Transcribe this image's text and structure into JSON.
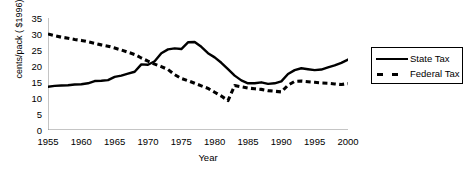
{
  "chart_data": {
    "type": "line",
    "title": "",
    "xlabel": "Year",
    "ylabel": "cents/pack ( $1996)",
    "xlim": [
      1955,
      2000
    ],
    "ylim": [
      0,
      35
    ],
    "ytick_step": 5,
    "xtick_step": 5,
    "minor_xticks": "every year",
    "grid": false,
    "legend_position": "right-outside",
    "yticks": [
      "0",
      "5",
      "10",
      "15",
      "20",
      "25",
      "30",
      "35"
    ],
    "xticks": [
      "1955",
      "1960",
      "1965",
      "1970",
      "1975",
      "1980",
      "1985",
      "1990",
      "1995",
      "2000"
    ],
    "x": [
      1955,
      1956,
      1957,
      1958,
      1959,
      1960,
      1961,
      1962,
      1963,
      1964,
      1965,
      1966,
      1967,
      1968,
      1969,
      1970,
      1971,
      1972,
      1973,
      1974,
      1975,
      1976,
      1977,
      1978,
      1979,
      1980,
      1981,
      1982,
      1983,
      1984,
      1985,
      1986,
      1987,
      1988,
      1989,
      1990,
      1991,
      1992,
      1993,
      1994,
      1995,
      1996,
      1997,
      1998,
      1999,
      2000
    ],
    "series": [
      {
        "name": "State Tax",
        "style": "solid",
        "color": "#000000",
        "values": [
          13.5,
          13.8,
          13.9,
          14.0,
          14.2,
          14.3,
          14.6,
          15.3,
          15.4,
          15.6,
          16.6,
          17.0,
          17.6,
          18.2,
          20.5,
          20.4,
          21.5,
          24.0,
          25.2,
          25.5,
          25.3,
          27.4,
          27.5,
          26.0,
          24.0,
          22.7,
          21.0,
          19.0,
          17.0,
          15.5,
          14.6,
          14.6,
          14.9,
          14.4,
          14.6,
          15.2,
          17.5,
          18.7,
          19.3,
          19.0,
          18.7,
          18.9,
          19.6,
          20.2,
          21.0,
          22.0
        ]
      },
      {
        "name": "Federal Tax",
        "style": "dashed",
        "color": "#000000",
        "values": [
          30.0,
          29.5,
          29.0,
          28.7,
          28.3,
          28.0,
          27.6,
          27.1,
          26.6,
          26.2,
          25.6,
          25.0,
          24.3,
          23.6,
          22.5,
          21.5,
          20.6,
          19.8,
          18.9,
          17.3,
          16.1,
          15.4,
          14.6,
          13.8,
          13.0,
          11.8,
          10.6,
          9.2,
          13.9,
          13.5,
          13.1,
          12.9,
          12.7,
          12.3,
          12.1,
          11.9,
          14.0,
          15.2,
          15.3,
          15.1,
          14.9,
          14.7,
          14.6,
          14.4,
          14.2,
          14.5
        ]
      }
    ]
  },
  "legend": {
    "items": [
      {
        "label": "State Tax",
        "style": "solid"
      },
      {
        "label": "Federal Tax",
        "style": "dashed"
      }
    ]
  }
}
